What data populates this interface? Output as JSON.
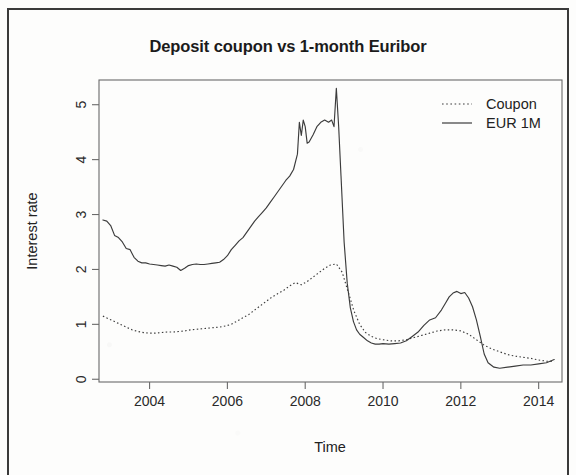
{
  "figure": {
    "title": "Deposit coupon vs 1-month Euribor",
    "xlabel": "Time",
    "ylabel": "Interest rate"
  },
  "legend": {
    "coupon_label": "Coupon",
    "euribor_label": "EUR 1M"
  },
  "axes": {
    "x_ticks": [
      "2004",
      "2006",
      "2008",
      "2010",
      "2012",
      "2014"
    ],
    "y_ticks": [
      "0",
      "1",
      "2",
      "3",
      "4",
      "5"
    ]
  },
  "colors": {
    "line": "#3c3c3c",
    "axis": "#555555",
    "text": "#1b1b1b",
    "frame": "#3a3a3a",
    "background": "#ffffff"
  },
  "chart_data": {
    "type": "line",
    "title": "Deposit coupon vs 1-month Euribor",
    "xlabel": "Time",
    "ylabel": "Interest rate",
    "xlim": [
      2002.7,
      2014.6
    ],
    "ylim": [
      -0.05,
      5.45
    ],
    "x_ticks": [
      2004,
      2006,
      2008,
      2010,
      2012,
      2014
    ],
    "y_ticks": [
      0,
      1,
      2,
      3,
      4,
      5
    ],
    "grid": false,
    "legend_position": "top-right",
    "series": [
      {
        "name": "Coupon",
        "style": "dotted",
        "x": [
          2002.8,
          2002.95,
          2003.1,
          2003.25,
          2003.4,
          2003.55,
          2003.7,
          2003.85,
          2004.0,
          2004.15,
          2004.3,
          2004.45,
          2004.6,
          2004.75,
          2004.9,
          2005.05,
          2005.2,
          2005.35,
          2005.5,
          2005.65,
          2005.8,
          2005.95,
          2006.1,
          2006.25,
          2006.4,
          2006.55,
          2006.7,
          2006.85,
          2007.0,
          2007.15,
          2007.3,
          2007.45,
          2007.6,
          2007.75,
          2007.9,
          2008.05,
          2008.2,
          2008.35,
          2008.5,
          2008.65,
          2008.8,
          2008.95,
          2009.1,
          2009.25,
          2009.4,
          2009.55,
          2009.7,
          2009.85,
          2010.0,
          2010.2,
          2010.4,
          2010.6,
          2010.8,
          2011.0,
          2011.2,
          2011.4,
          2011.6,
          2011.8,
          2012.0,
          2012.2,
          2012.4,
          2012.6,
          2012.8,
          2013.0,
          2013.2,
          2013.4,
          2013.6,
          2013.8,
          2014.0,
          2014.2,
          2014.4
        ],
        "y": [
          1.15,
          1.1,
          1.05,
          1.0,
          0.95,
          0.9,
          0.87,
          0.85,
          0.84,
          0.84,
          0.85,
          0.86,
          0.86,
          0.87,
          0.88,
          0.9,
          0.91,
          0.92,
          0.93,
          0.94,
          0.95,
          0.97,
          1.0,
          1.06,
          1.12,
          1.18,
          1.26,
          1.34,
          1.42,
          1.5,
          1.56,
          1.62,
          1.7,
          1.76,
          1.72,
          1.78,
          1.86,
          1.94,
          2.02,
          2.08,
          2.1,
          1.95,
          1.6,
          1.25,
          1.0,
          0.85,
          0.78,
          0.74,
          0.72,
          0.7,
          0.7,
          0.72,
          0.76,
          0.8,
          0.84,
          0.88,
          0.9,
          0.9,
          0.88,
          0.82,
          0.72,
          0.62,
          0.55,
          0.5,
          0.45,
          0.42,
          0.4,
          0.38,
          0.35,
          0.33,
          0.32
        ]
      },
      {
        "name": "EUR 1M",
        "style": "solid",
        "x": [
          2002.8,
          2002.9,
          2003.0,
          2003.1,
          2003.2,
          2003.3,
          2003.4,
          2003.5,
          2003.6,
          2003.7,
          2003.8,
          2003.9,
          2004.0,
          2004.1,
          2004.2,
          2004.3,
          2004.4,
          2004.5,
          2004.6,
          2004.7,
          2004.8,
          2004.9,
          2005.0,
          2005.1,
          2005.2,
          2005.3,
          2005.4,
          2005.5,
          2005.6,
          2005.7,
          2005.8,
          2005.9,
          2006.0,
          2006.1,
          2006.2,
          2006.3,
          2006.4,
          2006.5,
          2006.6,
          2006.7,
          2006.8,
          2006.9,
          2007.0,
          2007.1,
          2007.2,
          2007.3,
          2007.4,
          2007.5,
          2007.6,
          2007.7,
          2007.8,
          2007.85,
          2007.9,
          2007.95,
          2008.0,
          2008.05,
          2008.1,
          2008.2,
          2008.3,
          2008.4,
          2008.5,
          2008.6,
          2008.68,
          2008.74,
          2008.8,
          2008.86,
          2008.92,
          2009.0,
          2009.08,
          2009.16,
          2009.24,
          2009.32,
          2009.4,
          2009.5,
          2009.6,
          2009.7,
          2009.8,
          2009.9,
          2010.0,
          2010.15,
          2010.3,
          2010.45,
          2010.6,
          2010.75,
          2010.9,
          2011.05,
          2011.2,
          2011.35,
          2011.5,
          2011.6,
          2011.7,
          2011.8,
          2011.9,
          2012.0,
          2012.1,
          2012.2,
          2012.3,
          2012.4,
          2012.5,
          2012.6,
          2012.7,
          2012.85,
          2013.0,
          2013.2,
          2013.4,
          2013.6,
          2013.8,
          2014.0,
          2014.2,
          2014.4
        ],
        "y": [
          2.9,
          2.88,
          2.8,
          2.62,
          2.58,
          2.5,
          2.38,
          2.36,
          2.22,
          2.15,
          2.12,
          2.12,
          2.1,
          2.09,
          2.08,
          2.07,
          2.06,
          2.08,
          2.06,
          2.04,
          1.98,
          2.02,
          2.07,
          2.09,
          2.1,
          2.09,
          2.09,
          2.1,
          2.11,
          2.12,
          2.13,
          2.18,
          2.25,
          2.36,
          2.44,
          2.52,
          2.58,
          2.68,
          2.78,
          2.88,
          2.96,
          3.04,
          3.12,
          3.22,
          3.32,
          3.42,
          3.52,
          3.62,
          3.7,
          3.82,
          4.1,
          4.68,
          4.44,
          4.72,
          4.6,
          4.3,
          4.32,
          4.45,
          4.6,
          4.68,
          4.72,
          4.68,
          4.72,
          4.6,
          5.3,
          4.6,
          3.7,
          2.5,
          1.75,
          1.3,
          1.05,
          0.9,
          0.82,
          0.76,
          0.7,
          0.66,
          0.64,
          0.64,
          0.65,
          0.64,
          0.65,
          0.66,
          0.7,
          0.78,
          0.86,
          0.98,
          1.08,
          1.12,
          1.26,
          1.38,
          1.5,
          1.57,
          1.6,
          1.56,
          1.58,
          1.48,
          1.32,
          1.08,
          0.78,
          0.46,
          0.3,
          0.22,
          0.2,
          0.22,
          0.24,
          0.26,
          0.26,
          0.28,
          0.3,
          0.36
        ]
      }
    ]
  }
}
